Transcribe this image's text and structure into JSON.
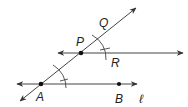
{
  "diagram": {
    "type": "geometric-construction",
    "labels": {
      "Q": "Q",
      "P": "P",
      "R": "R",
      "A": "A",
      "B": "B",
      "line": "ℓ"
    },
    "points": [
      {
        "name": "A",
        "x": 41,
        "y": 84
      },
      {
        "name": "B",
        "x": 119,
        "y": 84
      },
      {
        "name": "P",
        "x": 81,
        "y": 53
      }
    ],
    "lines": [
      {
        "name": "line-l",
        "through": [
          "A",
          "B"
        ],
        "arrows": "both"
      },
      {
        "name": "line-PR",
        "through": [
          "P",
          "R"
        ],
        "arrows": "both"
      },
      {
        "name": "transversal-AQ",
        "through": [
          "A",
          "P",
          "Q"
        ],
        "arrows": "both"
      }
    ],
    "arcs": [
      {
        "center": "A",
        "radius": 26
      },
      {
        "center": "P",
        "radius": 26
      }
    ],
    "colors": {
      "stroke": "#333333",
      "point": "#111111",
      "label": "#222222"
    }
  }
}
